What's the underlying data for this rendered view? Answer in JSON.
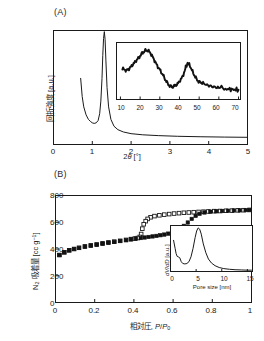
{
  "figure": {
    "panels": [
      {
        "tag": "(A)",
        "type": "xrd-small-angle",
        "xlabel_html": "2<span class=\"ital\">&#952;</span> [&#176;]",
        "ylabel": "回折強度 [a.u.]",
        "xticks": [
          "0",
          "1",
          "2",
          "3",
          "4",
          "5"
        ],
        "inset": {
          "xticks": [
            "10",
            "20",
            "30",
            "40",
            "50",
            "60",
            "70"
          ]
        }
      },
      {
        "tag": "(B)",
        "type": "n2-isotherm",
        "xlabel_html": "相対圧, <span class=\"ital\">P</span>/<span class=\"ital\">P</span><span class=\"sub\">0</span>",
        "ylabel_html": "N<span class=\"sub\">2</span> 吸着量 [cc g<span class=\"sup\">&#8722;1</span>]",
        "xticks": [
          "0",
          "0.2",
          "0.4",
          "0.6",
          "0.8",
          "1"
        ],
        "yticks": [
          "0",
          "200",
          "400",
          "600",
          "800"
        ],
        "inset": {
          "xlabel": "Pore size [nm]",
          "ylabel_html": "<span class=\"ital\">dV</span>/<span class=\"ital\">dD</span> [a.u.]",
          "xticks": [
            "0",
            "5",
            "10",
            "15"
          ]
        }
      }
    ]
  },
  "chart_data": [
    {
      "type": "line",
      "id": "panel-a-main",
      "title": "(A) Small-angle X-ray diffraction pattern",
      "xlabel": "2theta [deg]",
      "ylabel": "Diffraction intensity [a.u.]",
      "xlim": [
        0,
        5
      ],
      "ylim": [
        0,
        1
      ],
      "grid": false,
      "legend": "none",
      "notes": "Sharp (100) mesostructure peak near 2theta = 1.30 deg; signal starts at 0.70 deg with high low-angle tail, broad minimum near 1.05 deg, long flat baseline beyond 2 deg.",
      "series": [
        {
          "name": "XRD intensity",
          "x": [
            0.7,
            0.74,
            0.78,
            0.84,
            0.9,
            0.96,
            1.0,
            1.05,
            1.1,
            1.15,
            1.19,
            1.22,
            1.25,
            1.27,
            1.29,
            1.31,
            1.33,
            1.35,
            1.38,
            1.42,
            1.48,
            1.56,
            1.66,
            1.8,
            2.0,
            2.3,
            2.7,
            3.2,
            3.8,
            4.4,
            5.0
          ],
          "y": [
            0.58,
            0.42,
            0.33,
            0.26,
            0.22,
            0.2,
            0.19,
            0.185,
            0.19,
            0.21,
            0.27,
            0.38,
            0.58,
            0.78,
            0.93,
            0.99,
            0.92,
            0.74,
            0.5,
            0.33,
            0.22,
            0.16,
            0.13,
            0.11,
            0.095,
            0.085,
            0.078,
            0.072,
            0.068,
            0.065,
            0.063
          ]
        }
      ]
    },
    {
      "type": "line",
      "id": "panel-a-inset",
      "title": "(A) inset: wide-angle X-ray diffraction pattern",
      "xlabel": "2theta [deg]",
      "ylabel": "Diffraction intensity [a.u.]",
      "xlim": [
        8,
        71
      ],
      "ylim": [
        0,
        1
      ],
      "grid": false,
      "legend": "none",
      "notes": "Noisy amorphous-carbon pattern: broad (002) peak near 23 deg and sharper (101) peak near 44 deg, decaying tail to 70 deg.",
      "series": [
        {
          "name": "Wide-angle XRD intensity",
          "x": [
            11,
            13,
            15,
            17,
            19,
            21,
            23,
            25,
            27,
            29,
            31,
            33,
            35,
            37,
            39,
            41,
            43,
            44,
            45,
            47,
            49,
            51,
            54,
            57,
            60,
            64,
            67,
            70
          ],
          "y": [
            0.56,
            0.54,
            0.57,
            0.64,
            0.75,
            0.85,
            0.88,
            0.84,
            0.74,
            0.6,
            0.46,
            0.34,
            0.26,
            0.23,
            0.26,
            0.38,
            0.56,
            0.66,
            0.62,
            0.46,
            0.36,
            0.31,
            0.26,
            0.23,
            0.21,
            0.19,
            0.18,
            0.175
          ]
        }
      ]
    },
    {
      "type": "scatter",
      "id": "panel-b-main",
      "title": "(B) Nitrogen adsorption-desorption isotherm",
      "xlabel": "Relative pressure, P/P0",
      "ylabel": "N2 adsorbed [cc g-1]",
      "xlim": [
        0,
        1
      ],
      "ylim": [
        0,
        800
      ],
      "grid": false,
      "legend": "none",
      "notes": "Type IV isotherm with H1 hysteresis loop. Filled squares = adsorption branch, open squares = desorption branch. Branches coincide below P/P0 = 0.40 and above P/P0 = 0.75, plateau near 690 cc/g.",
      "series": [
        {
          "name": "Adsorption (filled squares)",
          "marker": "filled-square",
          "x": [
            0.02,
            0.045,
            0.07,
            0.095,
            0.12,
            0.15,
            0.18,
            0.21,
            0.24,
            0.27,
            0.3,
            0.33,
            0.36,
            0.385,
            0.41,
            0.435,
            0.455,
            0.475,
            0.495,
            0.515,
            0.535,
            0.555,
            0.575,
            0.595,
            0.615,
            0.635,
            0.655,
            0.675,
            0.695,
            0.715,
            0.735,
            0.76,
            0.79,
            0.82,
            0.85,
            0.88,
            0.91,
            0.94,
            0.97,
            0.99
          ],
          "y": [
            355,
            375,
            390,
            400,
            408,
            418,
            425,
            432,
            440,
            447,
            453,
            460,
            466,
            472,
            478,
            482,
            486,
            490,
            494,
            498,
            503,
            508,
            515,
            524,
            536,
            552,
            573,
            598,
            625,
            648,
            663,
            673,
            679,
            682,
            684,
            686,
            688,
            689,
            691,
            692
          ]
        },
        {
          "name": "Desorption (open squares)",
          "marker": "open-square",
          "x": [
            0.99,
            0.96,
            0.93,
            0.9,
            0.87,
            0.84,
            0.81,
            0.78,
            0.755,
            0.73,
            0.705,
            0.68,
            0.655,
            0.63,
            0.605,
            0.58,
            0.555,
            0.53,
            0.505,
            0.485,
            0.47,
            0.46,
            0.45,
            0.443,
            0.437,
            0.43,
            0.42,
            0.405,
            0.385,
            0.36,
            0.33,
            0.3,
            0.27,
            0.24,
            0.21,
            0.18,
            0.15,
            0.12,
            0.095,
            0.07,
            0.045,
            0.02
          ],
          "y": [
            692,
            690,
            689,
            687,
            686,
            684,
            683,
            681,
            679,
            677,
            675,
            673,
            671,
            668,
            665,
            661,
            657,
            652,
            646,
            637,
            625,
            608,
            585,
            552,
            512,
            490,
            482,
            478,
            474,
            468,
            461,
            455,
            449,
            442,
            434,
            427,
            419,
            409,
            400,
            390,
            375,
            355
          ]
        }
      ]
    },
    {
      "type": "line",
      "id": "panel-b-inset",
      "title": "(B) inset: BJH pore size distribution",
      "xlabel": "Pore size [nm]",
      "ylabel": "dV/dD [a.u.]",
      "xlim": [
        0,
        16
      ],
      "ylim": [
        0,
        1
      ],
      "grid": false,
      "legend": "none",
      "notes": "Sharp mesopore peak centred near 5.5 nm with a small micropore shoulder below 2 nm and a tail to 15 nm.",
      "series": [
        {
          "name": "dV/dD",
          "x": [
            0.6,
            0.9,
            1.1,
            1.3,
            1.5,
            1.8,
            2.1,
            2.4,
            2.8,
            3.2,
            3.6,
            4.0,
            4.4,
            4.8,
            5.1,
            5.4,
            5.7,
            6.0,
            6.4,
            6.9,
            7.4,
            8.0,
            8.7,
            9.5,
            10.4,
            11.5,
            12.6,
            13.8,
            15.0,
            15.8
          ],
          "y": [
            0.7,
            0.52,
            0.4,
            0.34,
            0.33,
            0.31,
            0.22,
            0.18,
            0.17,
            0.18,
            0.22,
            0.33,
            0.52,
            0.76,
            0.91,
            0.98,
            0.95,
            0.84,
            0.62,
            0.42,
            0.28,
            0.19,
            0.13,
            0.09,
            0.065,
            0.05,
            0.04,
            0.035,
            0.03,
            0.03
          ]
        }
      ]
    }
  ]
}
